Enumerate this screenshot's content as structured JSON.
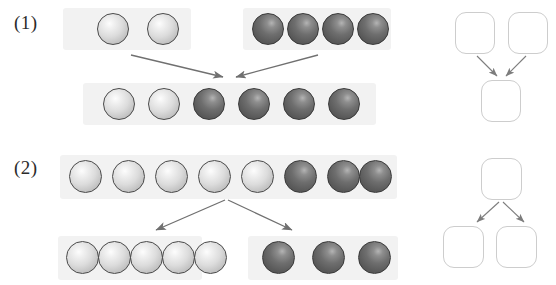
{
  "figure": {
    "title_visible": false,
    "background_color": "#ffffff",
    "band_color": "#f2f2f2",
    "arrow_color": "#6e6e6e",
    "node_stroke_color": "#cdcdcd",
    "sphere_light_color": "#dcdcdc",
    "sphere_dark_color": "#6e6e6e"
  },
  "panels": [
    {
      "label": "(1)",
      "operation": "merge",
      "description": "two input groups combine into one output group",
      "inputs": [
        {
          "name": "group-light",
          "count": 2,
          "shade": "light"
        },
        {
          "name": "group-dark",
          "count": 4,
          "shade": "dark"
        }
      ],
      "output": {
        "name": "group-merged",
        "count": 6,
        "shades": [
          "light",
          "light",
          "dark",
          "dark",
          "dark",
          "dark"
        ]
      },
      "schematic": {
        "top_nodes": 2,
        "bottom_nodes": 1,
        "arrow_direction": "converging"
      }
    },
    {
      "label": "(2)",
      "operation": "split",
      "description": "one input group separates into two output groups",
      "inputs": [
        {
          "name": "group-mixed",
          "count": 8,
          "shades": [
            "light",
            "light",
            "light",
            "light",
            "light",
            "dark",
            "dark",
            "dark"
          ]
        }
      ],
      "outputs": [
        {
          "name": "group-light-out",
          "count": 5,
          "shade": "light"
        },
        {
          "name": "group-dark-out",
          "count": 3,
          "shade": "dark"
        }
      ],
      "schematic": {
        "top_nodes": 1,
        "bottom_nodes": 2,
        "arrow_direction": "diverging"
      }
    }
  ]
}
